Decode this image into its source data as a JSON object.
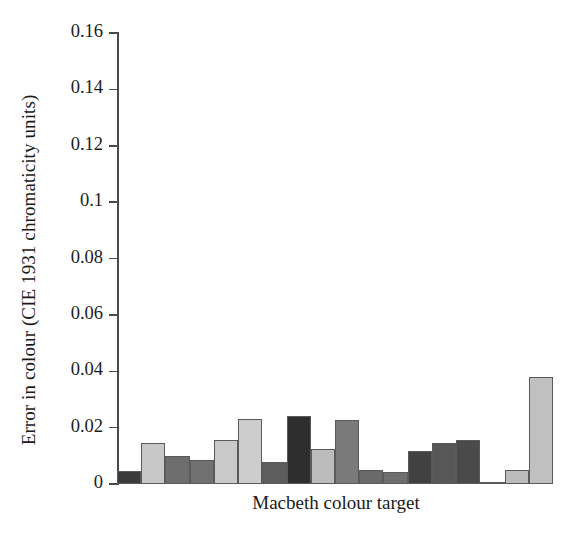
{
  "chart_data": {
    "type": "bar",
    "title": "",
    "xlabel": "Macbeth colour target",
    "ylabel": "Error in colour (CIE 1931 chromaticity units)",
    "ylim": [
      0,
      0.16
    ],
    "yticks": [
      "0",
      "0.02",
      "0.04",
      "0.06",
      "0.08",
      "0.1",
      "0.12",
      "0.14",
      "0.16"
    ],
    "ytick_values": [
      0,
      0.02,
      0.04,
      0.06,
      0.08,
      0.1,
      0.12,
      0.14,
      0.16
    ],
    "grid": false,
    "legend": "none",
    "categories": [
      "1",
      "2",
      "3",
      "4",
      "5",
      "6",
      "7",
      "8",
      "9",
      "10",
      "11",
      "12",
      "13",
      "14",
      "15",
      "16",
      "17",
      "18"
    ],
    "values": [
      0.0046,
      0.0145,
      0.0099,
      0.0085,
      0.0156,
      0.023,
      0.0078,
      0.0242,
      0.0124,
      0.0227,
      0.005,
      0.0043,
      0.0118,
      0.0146,
      0.0157,
      0.0008,
      0.0049,
      0.0378
    ],
    "bar_colors": [
      "#3b3b3b",
      "#c8c8c8",
      "#6e6e6e",
      "#717171",
      "#c9c9c9",
      "#cdcdcd",
      "#5d5d5d",
      "#2e2e2e",
      "#bcbcbc",
      "#7a7a7a",
      "#6a6a6a",
      "#6f6f6f",
      "#414141",
      "#575757",
      "#4a4a4a",
      "#5f5f5f",
      "#bcbcbc",
      "#c0c0c0"
    ],
    "axis_color": "#4a4a4a",
    "bar_edge_color": "#5a5a5a",
    "background_color": "#ffffff"
  },
  "axis": {
    "y_label": "Error in colour (CIE 1931 chromaticity units)",
    "x_label": "Macbeth colour target"
  }
}
